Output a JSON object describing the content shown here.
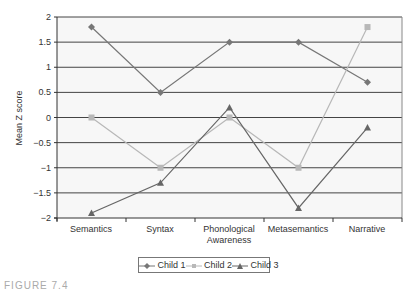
{
  "chart_data": {
    "type": "line",
    "title": "",
    "xlabel": "",
    "ylabel": "Mean Z score",
    "ylim": [
      -2,
      2
    ],
    "yticks": [
      "2",
      "1.5",
      "1",
      "0.5",
      "0",
      "−0.5",
      "−1",
      "−1.5",
      "−2"
    ],
    "grid": true,
    "legend_position": "bottom",
    "categories": [
      "Semantics",
      "Syntax",
      "Phonological Awareness",
      "Metasemantics",
      "Narrative"
    ],
    "series": [
      {
        "name": "Child 1",
        "marker": "diamond",
        "color": "#777777",
        "values": [
          1.8,
          0.5,
          1.5,
          1.5,
          0.7
        ]
      },
      {
        "name": "Child 2",
        "marker": "square",
        "color": "#b8b8b8",
        "values": [
          0,
          -1,
          0,
          -1,
          1.8
        ]
      },
      {
        "name": "Child 3",
        "marker": "triangle",
        "color": "#666666",
        "values": [
          -1.9,
          -1.3,
          0.2,
          -1.8,
          -0.2
        ]
      }
    ]
  },
  "labels": {
    "ylabel": "Mean Z score",
    "cat0": "Semantics",
    "cat1": "Syntax",
    "cat2a": "Phonological",
    "cat2b": "Awareness",
    "cat3": "Metasemantics",
    "cat4": "Narrative",
    "legend1": "Child 1",
    "legend2": "Child 2",
    "legend3": "Child 3",
    "caption": "FIGURE 7.4"
  }
}
